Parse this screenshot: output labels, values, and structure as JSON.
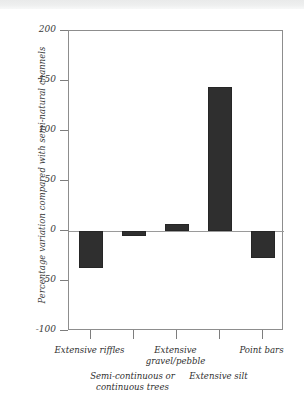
{
  "chart_data": {
    "type": "bar",
    "title": "",
    "xlabel": "",
    "ylabel": "Percentage variation compared with semi-natural channels",
    "categories": [
      "Extensive riffles",
      "Semi-continuous or\ncontinuous trees",
      "Extensive\ngravel/pebble",
      "Extensive silt",
      "Point bars"
    ],
    "values": [
      -37,
      -5,
      7,
      144,
      -27
    ],
    "ylim": [
      -100,
      200
    ],
    "yticks": [
      200,
      150,
      100,
      50,
      0,
      -50,
      -100
    ],
    "ytick_labels": [
      "200",
      "150",
      "100",
      "50",
      "0",
      "-50",
      "-100"
    ],
    "grid": false,
    "legend": "none",
    "bar_color": "#2f2f2f",
    "axis_color": "#8d8d8d",
    "zero_line": 0
  },
  "axis": {
    "y_title": "Percentage variation compared with semi-natural channels"
  },
  "category_rows": [
    {
      "label": "Extensive riffles",
      "row": 0
    },
    {
      "label": "Semi-continuous or\ncontinuous trees",
      "row": 1
    },
    {
      "label": "Extensive\ngravel/pebble",
      "row": 0
    },
    {
      "label": "Extensive silt",
      "row": 1
    },
    {
      "label": "Point bars",
      "row": 0
    }
  ]
}
